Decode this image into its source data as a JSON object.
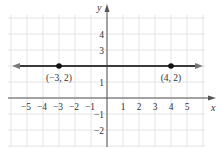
{
  "chart_data": {
    "type": "line",
    "title": "",
    "xlabel": "x",
    "ylabel": "y",
    "xlim": [
      -6,
      6
    ],
    "ylim": [
      -3,
      5
    ],
    "grid": true,
    "x_ticks": [
      "−5",
      "−4",
      "−3",
      "−2",
      "−1",
      "1",
      "2",
      "3",
      "4",
      "5"
    ],
    "y_ticks": [
      "4",
      "3",
      "1",
      "−1",
      "−2"
    ],
    "series": [
      {
        "name": "y = 2",
        "x": [
          -6,
          6
        ],
        "y": [
          2,
          2
        ]
      }
    ],
    "points": [
      {
        "x": -3,
        "y": 2,
        "label": "(−3, 2)"
      },
      {
        "x": 4,
        "y": 2,
        "label": "(4, 2)"
      }
    ]
  }
}
